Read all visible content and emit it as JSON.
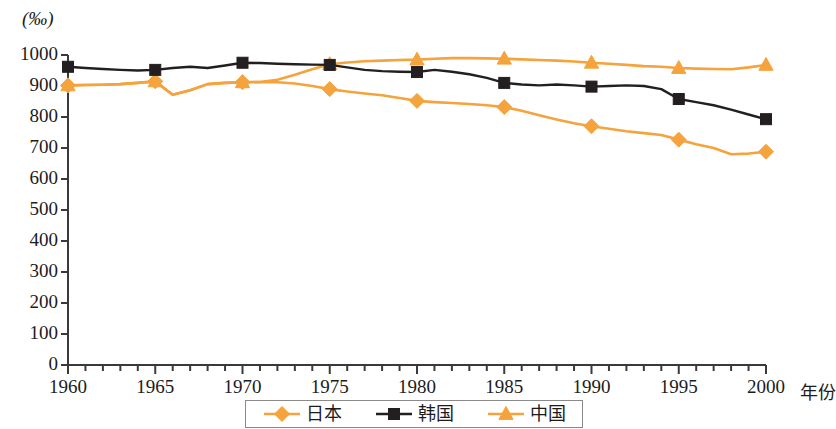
{
  "chart_data": {
    "type": "line",
    "title": "",
    "unit_label": "(‰)",
    "xlabel": "年份",
    "ylabel": "",
    "xlim": [
      1960,
      2000
    ],
    "ylim": [
      0,
      1000
    ],
    "grid": false,
    "legend_position": "bottom",
    "x_ticks_major": [
      "1960",
      "1965",
      "1970",
      "1975",
      "1980",
      "1985",
      "1990",
      "1995",
      "2000"
    ],
    "x_tick_values": [
      1960,
      1965,
      1970,
      1975,
      1980,
      1985,
      1990,
      1995,
      2000
    ],
    "x_minor_tick_step": 1,
    "y_ticks": [
      "0",
      "100",
      "200",
      "300",
      "400",
      "500",
      "600",
      "700",
      "800",
      "900",
      "1000"
    ],
    "y_tick_values": [
      0,
      100,
      200,
      300,
      400,
      500,
      600,
      700,
      800,
      900,
      1000
    ],
    "series": [
      {
        "name": "日本",
        "marker": "diamond",
        "color": "#F5A33C",
        "marker_years": [
          1960,
          1965,
          1970,
          1975,
          1980,
          1985,
          1990,
          1995,
          2000
        ],
        "marker_values": [
          902,
          915,
          912,
          890,
          852,
          832,
          770,
          727,
          688
        ],
        "x": [
          1960,
          1961,
          1962,
          1963,
          1964,
          1965,
          1966,
          1967,
          1968,
          1969,
          1970,
          1971,
          1972,
          1973,
          1974,
          1975,
          1976,
          1977,
          1978,
          1979,
          1980,
          1981,
          1982,
          1983,
          1984,
          1985,
          1986,
          1987,
          1988,
          1989,
          1990,
          1991,
          1992,
          1993,
          1994,
          1995,
          1996,
          1997,
          1998,
          1999,
          2000
        ],
        "values": [
          902,
          903,
          904,
          906,
          910,
          915,
          872,
          886,
          906,
          910,
          912,
          913,
          912,
          908,
          900,
          890,
          882,
          876,
          870,
          861,
          852,
          848,
          845,
          842,
          838,
          832,
          820,
          806,
          792,
          780,
          770,
          762,
          754,
          748,
          742,
          727,
          712,
          700,
          680,
          682,
          688
        ]
      },
      {
        "name": "韩国",
        "marker": "square",
        "color": "#231F20",
        "marker_years": [
          1960,
          1965,
          1970,
          1975,
          1980,
          1985,
          1990,
          1995,
          2000
        ],
        "marker_values": [
          962,
          952,
          975,
          968,
          945,
          910,
          898,
          858,
          793
        ],
        "x": [
          1960,
          1961,
          1962,
          1963,
          1964,
          1965,
          1966,
          1967,
          1968,
          1969,
          1970,
          1971,
          1972,
          1973,
          1974,
          1975,
          1976,
          1977,
          1978,
          1979,
          1980,
          1981,
          1982,
          1983,
          1984,
          1985,
          1986,
          1987,
          1988,
          1989,
          1990,
          1991,
          1992,
          1993,
          1994,
          1995,
          1996,
          1997,
          1998,
          1999,
          2000
        ],
        "values": [
          962,
          958,
          955,
          952,
          950,
          952,
          958,
          962,
          958,
          966,
          975,
          974,
          972,
          970,
          969,
          968,
          960,
          952,
          948,
          946,
          945,
          952,
          946,
          938,
          926,
          910,
          905,
          902,
          905,
          902,
          898,
          900,
          902,
          900,
          890,
          858,
          848,
          838,
          824,
          808,
          793
        ]
      },
      {
        "name": "中国",
        "marker": "triangle",
        "color": "#F5A33C",
        "marker_years": [
          1960,
          1965,
          1970,
          1975,
          1980,
          1985,
          1990,
          1995,
          2000
        ],
        "marker_values": [
          902,
          915,
          912,
          970,
          985,
          988,
          975,
          958,
          968
        ],
        "x": [
          1960,
          1961,
          1962,
          1963,
          1964,
          1965,
          1966,
          1967,
          1968,
          1969,
          1970,
          1971,
          1972,
          1973,
          1974,
          1975,
          1976,
          1977,
          1978,
          1979,
          1980,
          1981,
          1982,
          1983,
          1984,
          1985,
          1986,
          1987,
          1988,
          1989,
          1990,
          1991,
          1992,
          1993,
          1994,
          1995,
          1996,
          1997,
          1998,
          1999,
          2000
        ],
        "values": [
          902,
          903,
          904,
          906,
          910,
          915,
          872,
          886,
          906,
          910,
          912,
          913,
          920,
          936,
          954,
          970,
          976,
          980,
          982,
          984,
          985,
          988,
          990,
          990,
          989,
          988,
          986,
          984,
          982,
          979,
          975,
          972,
          968,
          964,
          962,
          958,
          956,
          955,
          954,
          960,
          968
        ]
      }
    ]
  },
  "legend": {
    "items": [
      {
        "label": "日本",
        "marker": "diamond",
        "color": "#F5A33C"
      },
      {
        "label": "韩国",
        "marker": "square",
        "color": "#231F20"
      },
      {
        "label": "中国",
        "marker": "triangle",
        "color": "#F5A33C"
      }
    ]
  },
  "axes": {
    "unit_label": "(‰)",
    "x_title": "年份"
  }
}
